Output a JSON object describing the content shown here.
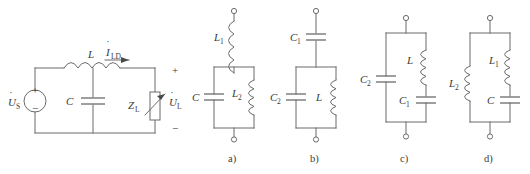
{
  "figure": {
    "background_color": "#ffffff",
    "line_color": "#6b6b6b",
    "text_color": "#3a3a3a"
  },
  "main_circuit": {
    "name": "source-filter-load-circuit",
    "source_label": "U",
    "source_sub": "S",
    "source_plus": "+",
    "source_minus": "−",
    "inductor_label": "L",
    "capacitor_label": "C",
    "current_label": "I",
    "current_sub": "LD",
    "impedance_label": "Z",
    "impedance_sub": "L",
    "output_voltage_label": "U",
    "output_voltage_sub": "L",
    "output_plus": "+",
    "output_minus": "−"
  },
  "options": [
    {
      "caption": "a)",
      "name": "option-a",
      "series_element": {
        "type": "inductor",
        "label": "L",
        "sub": "1"
      },
      "left_branch": {
        "type": "capacitor",
        "label": "C",
        "sub": ""
      },
      "right_branch": [
        {
          "type": "inductor",
          "label": "L",
          "sub": "2"
        }
      ]
    },
    {
      "caption": "b)",
      "name": "option-b",
      "series_element": {
        "type": "capacitor",
        "label": "C",
        "sub": "1"
      },
      "left_branch": {
        "type": "capacitor",
        "label": "C",
        "sub": "2"
      },
      "right_branch": [
        {
          "type": "inductor",
          "label": "L",
          "sub": ""
        }
      ]
    },
    {
      "caption": "c)",
      "name": "option-c",
      "series_element": null,
      "left_branch": {
        "type": "capacitor",
        "label": "C",
        "sub": "2"
      },
      "right_branch": [
        {
          "type": "inductor",
          "label": "L",
          "sub": ""
        },
        {
          "type": "capacitor",
          "label": "C",
          "sub": "1"
        }
      ]
    },
    {
      "caption": "d)",
      "name": "option-d",
      "series_element": null,
      "left_branch": {
        "type": "inductor",
        "label": "L",
        "sub": "2"
      },
      "right_branch": [
        {
          "type": "inductor",
          "label": "L",
          "sub": "1"
        },
        {
          "type": "capacitor",
          "label": "C",
          "sub": ""
        }
      ]
    }
  ]
}
